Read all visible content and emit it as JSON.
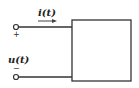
{
  "diagram": {
    "type": "one-port network",
    "current_label": "i(t)",
    "voltage_label": "u(t)",
    "plus_sign": "+",
    "minus_sign": "−",
    "colors": {
      "line": "#333333",
      "background": "#ffffff"
    }
  }
}
